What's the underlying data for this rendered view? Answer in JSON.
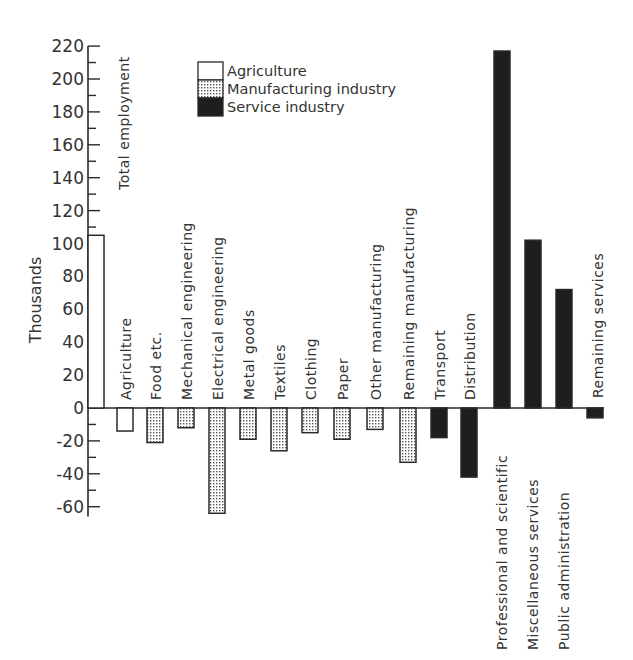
{
  "chart_data": {
    "type": "bar",
    "title": "",
    "xlabel": "",
    "ylabel": "Thousands",
    "ylim": [
      -66,
      220
    ],
    "yticks": [
      220,
      200,
      180,
      160,
      140,
      120,
      100,
      80,
      60,
      40,
      20,
      0,
      -20,
      -40,
      -60
    ],
    "grid": false,
    "legend_position": "top-left-inside",
    "legend": [
      {
        "name": "Agriculture",
        "pattern": "open"
      },
      {
        "name": "Manufacturing industry",
        "pattern": "dotted"
      },
      {
        "name": "Service industry",
        "pattern": "solid"
      }
    ],
    "categories": [
      "Total employment",
      "Agriculture",
      "Food etc.",
      "Mechanical engineering",
      "Electrical engineering",
      "Metal goods",
      "Textiles",
      "Clothing",
      "Paper",
      "Other manufacturing",
      "Remaining manufacturing",
      "Transport",
      "Distribution",
      "Professional and scientific",
      "Miscellaneous services",
      "Public administration",
      "Remaining services"
    ],
    "values": [
      105,
      -14,
      -21,
      -12,
      -64,
      -19,
      -26,
      -15,
      -19,
      -13,
      -33,
      -18,
      -42,
      217,
      102,
      72,
      -6
    ],
    "groups": [
      "total",
      "agriculture",
      "manufacturing",
      "manufacturing",
      "manufacturing",
      "manufacturing",
      "manufacturing",
      "manufacturing",
      "manufacturing",
      "manufacturing",
      "manufacturing",
      "service",
      "service",
      "service",
      "service",
      "service",
      "service"
    ]
  },
  "colors": {
    "ink": "#2a2a2a",
    "service_fill": "#1e1e1e",
    "dot": "#555555"
  }
}
